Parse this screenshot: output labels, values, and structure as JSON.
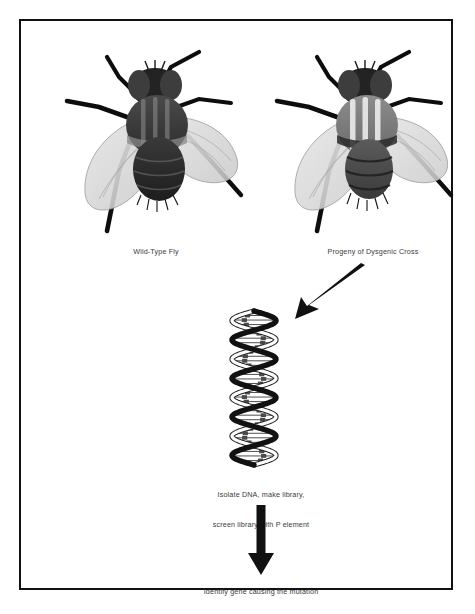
{
  "figure": {
    "type": "scientific-diagram",
    "border_color": "#121212",
    "background_color": "#ffffff",
    "text_color": "#3a3a3a"
  },
  "panels": {
    "wildtype": {
      "caption": "Wild-Type Fly",
      "icon_name": "fly-wildtype-illustration",
      "body_color": "#3f3f3f",
      "wing_color": "#d8d8d8",
      "leg_color": "#111111"
    },
    "mutant": {
      "caption": "Progeny of Dysgenic Cross",
      "icon_name": "fly-mutant-illustration",
      "body_color": "#6d6d6d",
      "wing_color": "#d8d8d8",
      "leg_color": "#111111"
    }
  },
  "arrows": {
    "diagonal": {
      "name": "arrow-diagonal-down-left",
      "direction": "down-left",
      "color": "#111111"
    },
    "vertical": {
      "name": "arrow-vertical-down",
      "direction": "down",
      "color": "#111111"
    }
  },
  "dna": {
    "name": "dna-double-helix",
    "turns": 4,
    "strand_dark_color": "#111111",
    "strand_light_color": "#ffffff",
    "rung_color": "#222222",
    "base_mark_color": "#4a4a4a"
  },
  "steps": {
    "isolate_line1": "Isolate DNA, make library,",
    "isolate_line2": "screen library with P element",
    "identify": "Identify gene causing the mutation"
  }
}
